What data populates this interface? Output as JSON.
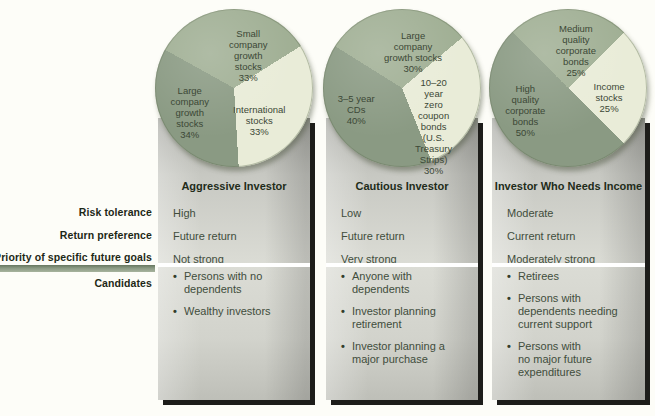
{
  "palette": {
    "slice_medium": "#a0af94",
    "slice_light": "#e9ecd8",
    "slice_dark": "#8a9a83",
    "panel_shadow": "#1d1d1a",
    "green_rule": "#8b9a84",
    "white_rule": "#ffffff",
    "heading_text": "#222c1a",
    "body_text": "#414d3c"
  },
  "row_labels": {
    "risk": "Risk tolerance",
    "return": "Return preference",
    "priority": "Priority of specific future goals",
    "candidates": "Candidates"
  },
  "columns": [
    {
      "title": "Aggressive Investor",
      "risk_tolerance": "High",
      "return_preference": "Future return",
      "priority": "Not strong",
      "candidates": [
        "Persons with no\ndependents",
        "Wealthy investors"
      ]
    },
    {
      "title": "Cautious Investor",
      "risk_tolerance": "Low",
      "return_preference": "Future return",
      "priority": "Very strong",
      "candidates": [
        "Anyone with\ndependents",
        "Investor planning\nretirement",
        "Investor planning a\nmajor purchase"
      ]
    },
    {
      "title": "Investor Who Needs Income",
      "risk_tolerance": "Moderate",
      "return_preference": "Current return",
      "priority": "Moderately strong",
      "candidates": [
        "Retirees",
        "Persons with\ndependents needing\ncurrent support",
        "Persons with\nno major future\nexpenditures"
      ]
    }
  ],
  "chart_data": [
    {
      "type": "pie",
      "title": "Aggressive Investor allocation",
      "start_angle_deg": -61,
      "legend_position": "in-slice",
      "slices": [
        {
          "label": "Small company growth stocks",
          "value": 33,
          "color_key": "slice_medium",
          "label_lines": [
            "Small",
            "company",
            "growth",
            "stocks",
            "33%"
          ],
          "label_x_pct": 59,
          "label_y_pct": 29
        },
        {
          "label": "International stocks",
          "value": 33,
          "color_key": "slice_light",
          "label_lines": [
            "International",
            "stocks",
            "33%"
          ],
          "label_x_pct": 66,
          "label_y_pct": 70
        },
        {
          "label": "Large company growth stocks",
          "value": 34,
          "color_key": "slice_dark",
          "label_lines": [
            "Large",
            "company",
            "growth",
            "stocks",
            "34%"
          ],
          "label_x_pct": 22,
          "label_y_pct": 65
        }
      ]
    },
    {
      "type": "pie",
      "title": "Cautious Investor allocation",
      "start_angle_deg": -58,
      "legend_position": "in-slice",
      "slices": [
        {
          "label": "Large company growth stocks",
          "value": 30,
          "color_key": "slice_medium",
          "label_lines": [
            "Large",
            "company",
            "growth stocks",
            "30%"
          ],
          "label_x_pct": 57,
          "label_y_pct": 27
        },
        {
          "label": "10–20 year zero coupon bonds (U.S. Treasury Strips)",
          "value": 30,
          "color_key": "slice_light",
          "label_lines": [
            "10–20 year",
            "zero coupon",
            "bonds",
            "(U.S. Treasury",
            "Strips)",
            "30%"
          ],
          "label_x_pct": 70,
          "label_y_pct": 74
        },
        {
          "label": "3–5 year CDs",
          "value": 40,
          "color_key": "slice_dark",
          "label_lines": [
            "3–5 year",
            "CDs",
            "40%"
          ],
          "label_x_pct": 21,
          "label_y_pct": 63
        }
      ]
    },
    {
      "type": "pie",
      "title": "Investor Who Needs Income allocation",
      "start_angle_deg": -45,
      "legend_position": "in-slice",
      "slices": [
        {
          "label": "Medium quality corporate bonds",
          "value": 25,
          "color_key": "slice_medium",
          "label_lines": [
            "Medium",
            "quality",
            "corporate",
            "bonds",
            "25%"
          ],
          "label_x_pct": 55,
          "label_y_pct": 26
        },
        {
          "label": "Income stocks",
          "value": 25,
          "color_key": "slice_light",
          "label_lines": [
            "Income",
            "stocks",
            "25%"
          ],
          "label_x_pct": 76,
          "label_y_pct": 56
        },
        {
          "label": "High quality corporate bonds",
          "value": 50,
          "color_key": "slice_dark",
          "label_lines": [
            "High",
            "quality",
            "corporate",
            "bonds",
            "50%"
          ],
          "label_x_pct": 23,
          "label_y_pct": 64
        }
      ]
    }
  ]
}
